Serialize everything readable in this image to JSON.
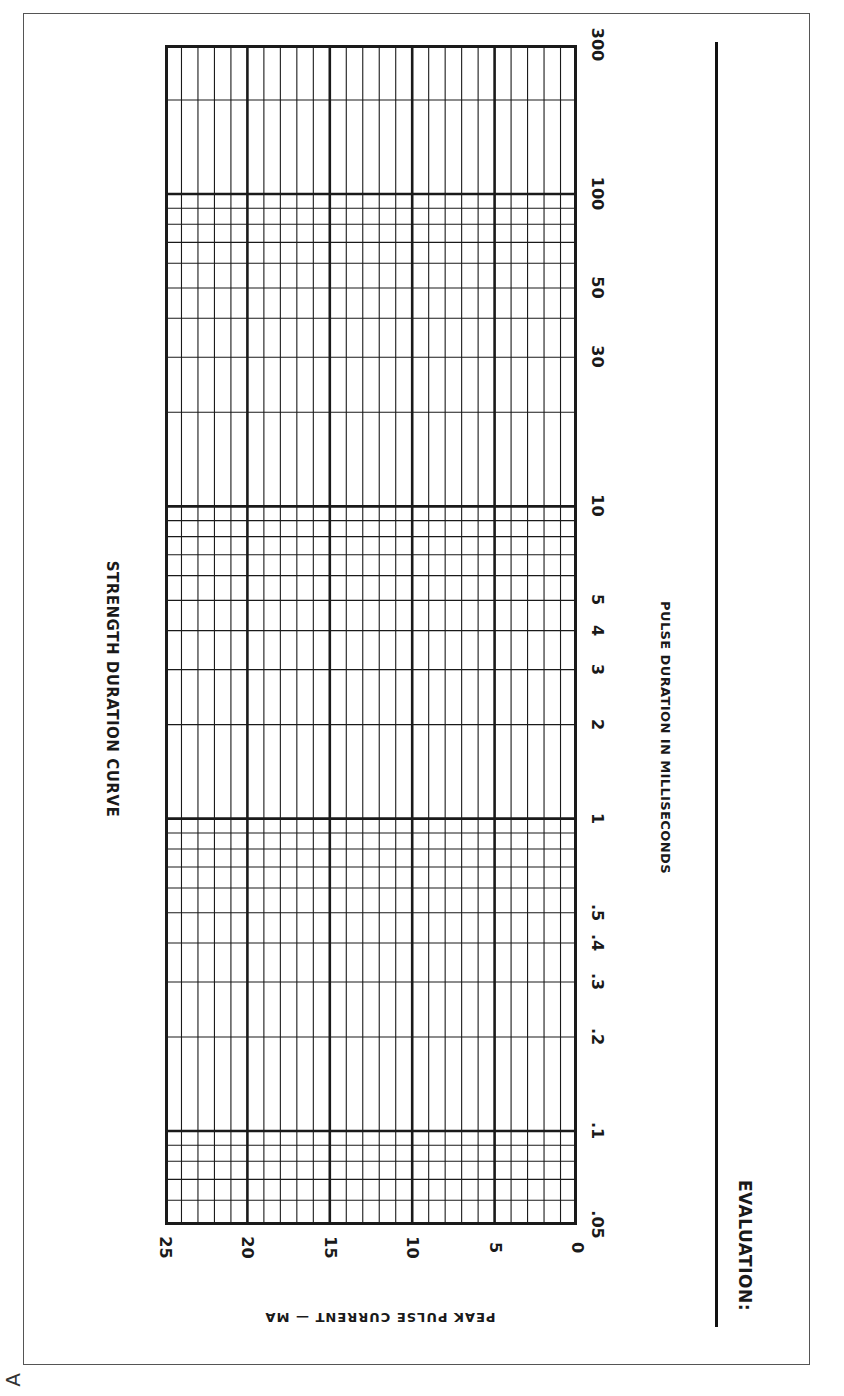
{
  "title": "STRENGTH DURATION CURVE",
  "x_axis_label": "PULSE DURATION IN MILLISECONDS",
  "y_axis_label": "PEAK PULSE CURRENT — MA",
  "evaluation_label": "EVALUATION:",
  "corner_mark": "A",
  "duration_ticks": [
    ".05",
    ".1",
    ".2",
    ".3",
    ".4",
    ".5",
    "1",
    "2",
    "3",
    "4",
    "5",
    "10",
    "30",
    "50",
    "100",
    "300"
  ],
  "current_ticks": [
    "25",
    "20",
    "15",
    "10",
    "5",
    "0"
  ],
  "colors": {
    "ink": "#1a1a1a",
    "paper": "#ffffff",
    "frame": "#555555"
  },
  "chart_data": {
    "type": "line",
    "title": "STRENGTH DURATION CURVE",
    "xlabel": "PULSE DURATION IN MILLISECONDS",
    "ylabel": "PEAK PULSE CURRENT — MA",
    "x_scale": "log",
    "x_range": [
      0.05,
      300
    ],
    "x_ticks": [
      0.05,
      0.1,
      0.2,
      0.3,
      0.4,
      0.5,
      1,
      2,
      3,
      4,
      5,
      10,
      30,
      50,
      100,
      300
    ],
    "y_scale": "linear",
    "y_range": [
      0,
      25
    ],
    "y_ticks": [
      0,
      5,
      10,
      15,
      20,
      25
    ],
    "y_minor_step": 1,
    "grid": true,
    "orientation": "rotated 90° (duration axis runs vertically, current axis horizontally)",
    "series": [],
    "note": "Blank graph template; no data plotted"
  }
}
